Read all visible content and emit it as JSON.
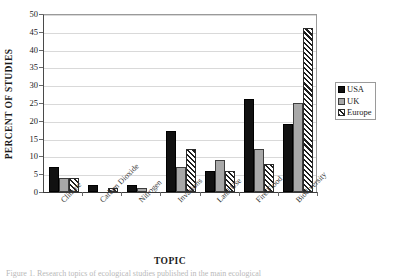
{
  "chart_data": {
    "type": "bar",
    "title": "",
    "xlabel": "TOPIC",
    "ylabel": "PERCENT OF STUDIES",
    "ylim": [
      0,
      50
    ],
    "ytick_step": 5,
    "yticks": [
      "50",
      "45",
      "40",
      "35",
      "30",
      "25",
      "20",
      "15",
      "10",
      "5",
      "0"
    ],
    "grid": true,
    "legend_position": "right",
    "categories": [
      "Climate",
      "Carbon Dioxide",
      "Nitrogen",
      "Invasions",
      "Land Use",
      "Fire/Flood",
      "Biodiversity"
    ],
    "series": [
      {
        "name": "USA",
        "color": "#111111",
        "pattern": "solid",
        "values": [
          7,
          2,
          2,
          17,
          6,
          26,
          19
        ]
      },
      {
        "name": "UK",
        "color": "#a8a8a8",
        "pattern": "solid",
        "values": [
          4,
          0,
          1,
          7,
          9,
          12,
          25
        ]
      },
      {
        "name": "Europe",
        "color": "#ffffff",
        "pattern": "diagonal-hatch",
        "values": [
          4,
          1,
          0,
          12,
          6,
          8,
          46
        ]
      }
    ]
  },
  "legend": {
    "items": [
      {
        "label": "USA"
      },
      {
        "label": "UK"
      },
      {
        "label": "Europe"
      }
    ]
  },
  "caption": "Figure 1. Research topics of ecological studies published in the main ecological"
}
